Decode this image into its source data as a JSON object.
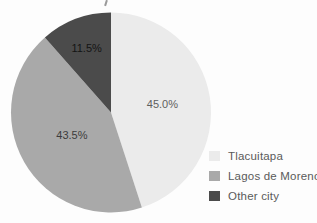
{
  "chart_data": {
    "type": "pie",
    "title": "",
    "start_angle_deg": 0,
    "direction": "clockwise",
    "legend_position": "right-bottom",
    "slices": [
      {
        "label": "Tlacuitapa",
        "value": 45.0,
        "display": "45.0%",
        "color": "#ebebeb",
        "label_color": "#5e5e5e",
        "label_radius": 0.52
      },
      {
        "label": "Lagos de Moreno",
        "value": 43.5,
        "display": "43.5%",
        "color": "#a9a9a9",
        "label_color": "#3c3c3c",
        "label_radius": 0.45
      },
      {
        "label": "Other city",
        "value": 11.5,
        "display": "11.5%",
        "color": "#4b4b4b",
        "label_color": "#141414",
        "label_radius": 0.69
      }
    ]
  },
  "colors": {
    "background": "#fdfdfd",
    "legend_text": "#5a5a5a"
  }
}
